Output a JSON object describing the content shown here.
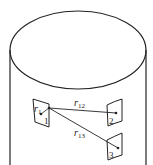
{
  "diagram": {
    "type": "cylinder-surface-patches",
    "stroke_color": "#222222",
    "background": "#ffffff",
    "patches": [
      {
        "id": "1",
        "label": "1"
      },
      {
        "id": "2",
        "label": "2"
      },
      {
        "id": "3",
        "label": "3"
      }
    ],
    "vectors": [
      {
        "id": "r1",
        "label_base": "r",
        "label_sub": "1"
      },
      {
        "id": "r12",
        "label_base": "r",
        "label_sub": "12",
        "from": "1",
        "to": "2"
      },
      {
        "id": "r13",
        "label_base": "r",
        "label_sub": "13",
        "from": "1",
        "to": "3"
      }
    ]
  }
}
